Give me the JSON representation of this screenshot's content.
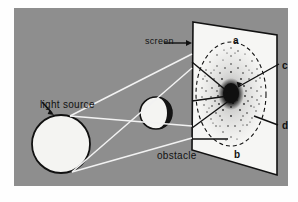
{
  "figure": {
    "kind": "physics-diagram",
    "background_color": "#8e8e8e",
    "page_color": "#fefefe"
  },
  "labels": {
    "light_source": "light source",
    "obstacle": "obstacle",
    "screen": "screen",
    "a": "a",
    "b": "b",
    "c": "c",
    "d": "d"
  },
  "colors": {
    "ray": "#f2f2f2",
    "leader": "#111111",
    "source_fill": "#f4f4f2",
    "obstacle_light": "#f4f4f2",
    "obstacle_dark": "#141414",
    "screen_fill": "#f6f6f4",
    "outline": "#111111",
    "speckle": "#2a2a2a"
  },
  "elements": {
    "light_source_shape": "circle",
    "obstacle_shape": "sphere-with-shadow-crescent",
    "screen_shape": "parallelogram-in-perspective",
    "pattern": "dashed-ellipse-with-speckled-diffraction-rings",
    "central_spot": "bright-dark-poisson-spot"
  },
  "icons": {
    "arrow_light_source": "arrow-down-right-icon",
    "arrow_screen": "arrow-right-icon",
    "arrow_c": "arrow-down-left-icon"
  }
}
